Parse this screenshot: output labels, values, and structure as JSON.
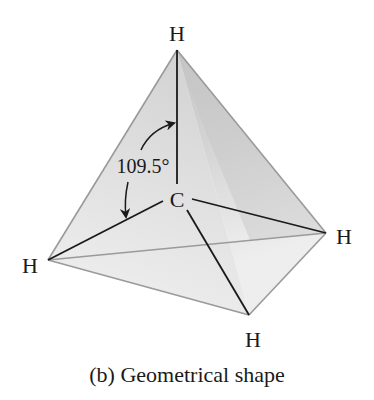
{
  "figure": {
    "caption": "(b) Geometrical shape",
    "molecule": "CH4",
    "shape": "tetrahedral",
    "atoms": {
      "center": "C",
      "top": "H",
      "left": "H",
      "right": "H",
      "bottom": "H"
    },
    "bond_angle_label": "109.5°"
  },
  "colors": {
    "edge": "#9a9a9a",
    "bond": "#1a1a1a",
    "face_left": "#dcdcdc",
    "face_right_light": "#e6e6e6",
    "face_right_dark": "#c4c4c4",
    "face_bottom": "#f0f0f0",
    "text": "#1a1a1a"
  }
}
